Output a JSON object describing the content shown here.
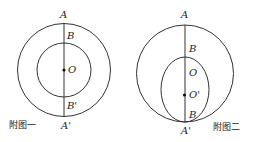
{
  "figure1": {
    "caption": "附图一",
    "labels": {
      "A": "A",
      "B": "B",
      "O": "O",
      "B_prime": "B'",
      "A_prime": "A'"
    }
  },
  "figure2": {
    "caption": "附图二",
    "labels": {
      "A": "A",
      "B_top": "B",
      "O": "O",
      "O_prime": "O'",
      "B_bottom": "B",
      "A_prime": "A'"
    }
  }
}
